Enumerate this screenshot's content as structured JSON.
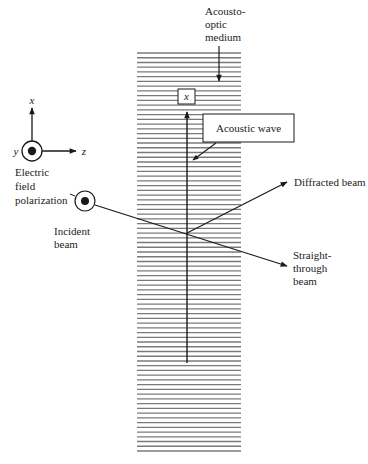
{
  "colors": {
    "ink": "#1a1a1a",
    "grating": "#7a7a7a",
    "background": "#ffffff"
  },
  "labels": {
    "medium": [
      "Acousto-",
      "optic",
      "medium"
    ],
    "acoustic_wave": "Acoustic wave",
    "diffracted_beam": "Diffracted beam",
    "straight_through": [
      "Straight-",
      "through",
      "beam"
    ],
    "incident_beam": [
      "Incident",
      "beam"
    ],
    "polarization": [
      "Electric",
      "field",
      "polarization"
    ],
    "axis_box": "x"
  },
  "coordinate_system": {
    "x_label": "x",
    "y_label": "y",
    "z_label": "z"
  },
  "grating": {
    "line_count": 85
  }
}
